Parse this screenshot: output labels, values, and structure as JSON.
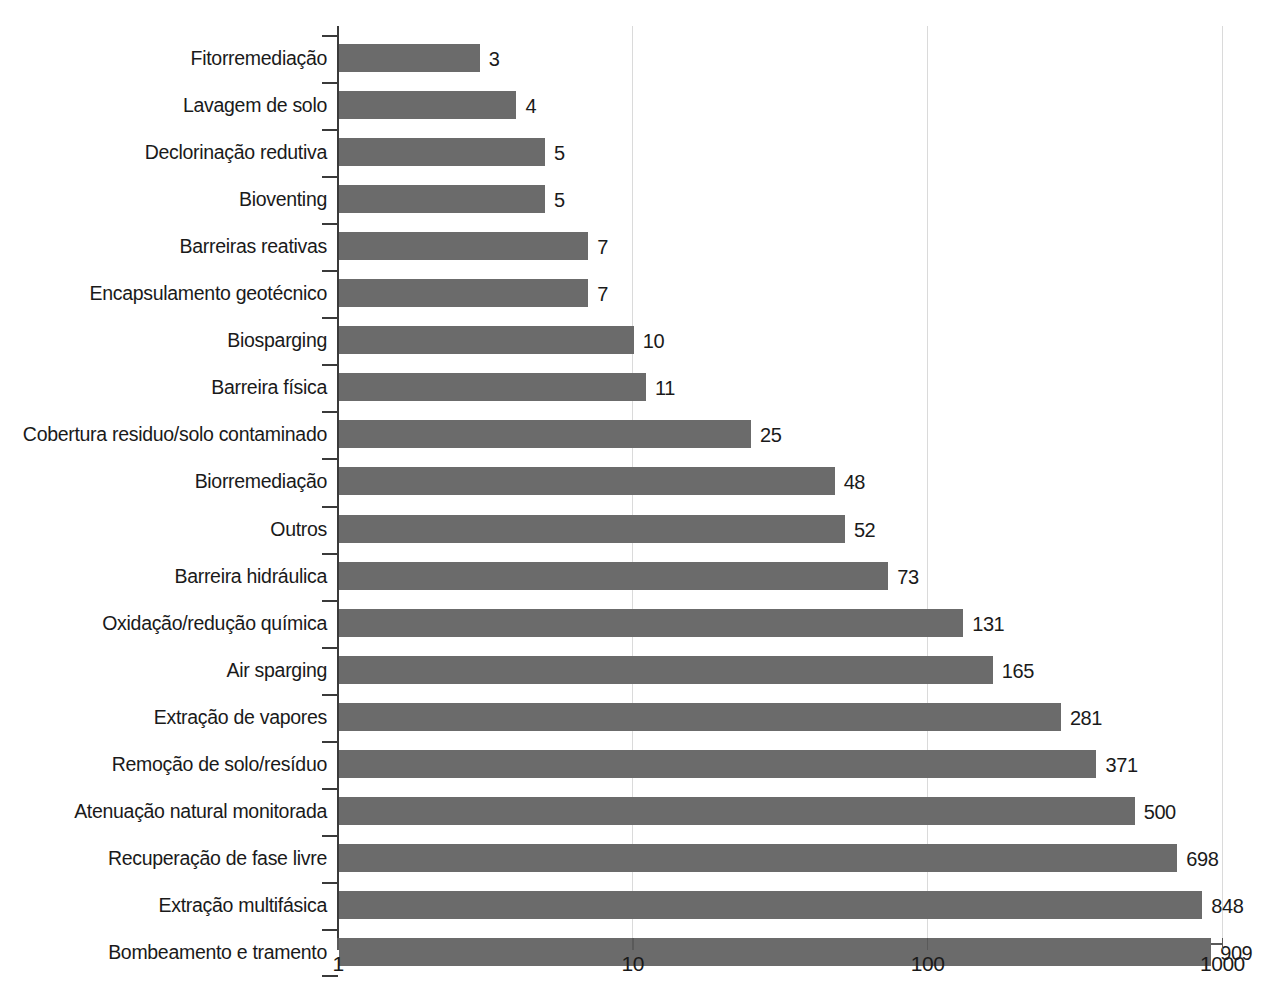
{
  "chart_data": {
    "type": "bar",
    "orientation": "horizontal",
    "title": "",
    "subtitle": "",
    "xlabel": "",
    "ylabel": "",
    "xscale": "log",
    "xlim": [
      1,
      1000
    ],
    "xticks": [
      "1",
      "10",
      "100",
      "1000"
    ],
    "xtick_values": [
      1,
      10,
      100,
      1000
    ],
    "grid": "vertical-only",
    "legend": "none",
    "bar_color": "#6b6b6b",
    "axis_color": "#3a3a3a",
    "grid_color": "#dadada",
    "background_color": "#ffffff",
    "categories": [
      "Fitorremediação",
      "Lavagem de solo",
      "Declorinação redutiva",
      "Bioventing",
      "Barreiras reativas",
      "Encapsulamento geotécnico",
      "Biosparging",
      "Barreira física",
      "Cobertura residuo/solo contaminado",
      "Biorremediação",
      "Outros",
      "Barreira hidráulica",
      "Oxidação/redução química",
      "Air sparging",
      "Extração de vapores",
      "Remoção de solo/resíduo",
      "Atenuação natural monitorada",
      "Recuperação de fase livre",
      "Extração multifásica",
      "Bombeamento e tramento"
    ],
    "values": [
      3,
      4,
      5,
      5,
      7,
      7,
      10,
      11,
      25,
      48,
      52,
      73,
      131,
      165,
      281,
      371,
      500,
      698,
      848,
      909
    ],
    "value_labels": [
      "3",
      "4",
      "5",
      "5",
      "7",
      "7",
      "10",
      "11",
      "25",
      "48",
      "52",
      "73",
      "131",
      "165",
      "281",
      "371",
      "500",
      "698",
      "848",
      "909"
    ]
  }
}
